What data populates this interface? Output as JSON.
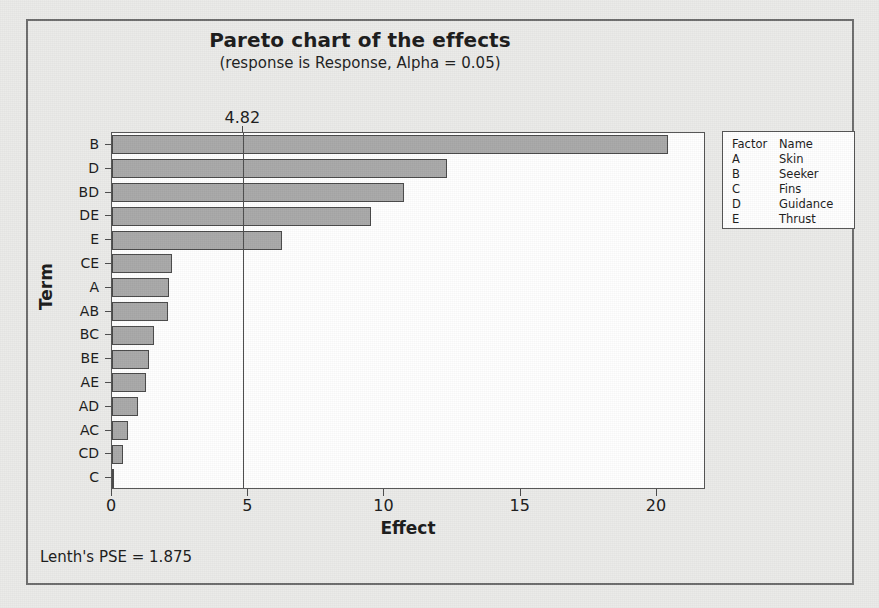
{
  "chart_data": {
    "type": "bar",
    "orientation": "horizontal",
    "title": "Pareto chart of the effects",
    "subtitle": "(response is Response, Alpha = 0.05)",
    "xlabel": "Effect",
    "ylabel": "Term",
    "categories": [
      "B",
      "D",
      "BD",
      "DE",
      "E",
      "CE",
      "A",
      "AB",
      "BC",
      "BE",
      "AE",
      "AD",
      "AC",
      "CD",
      "C"
    ],
    "values": [
      20.4,
      12.3,
      10.7,
      9.5,
      6.25,
      2.2,
      2.1,
      2.05,
      1.55,
      1.35,
      1.25,
      0.95,
      0.6,
      0.4,
      0.05
    ],
    "xlim": [
      0,
      21.8
    ],
    "xticks": [
      0,
      5,
      10,
      15,
      20
    ],
    "xtick_labels": [
      "0",
      "5",
      "10",
      "15",
      "20"
    ],
    "grid": false,
    "reference_line": {
      "value": 4.82,
      "label": "4.82"
    },
    "bar_color": "#a9a9a9",
    "bar_edge_color": "#4a4a4a",
    "legend_position": "right-outside"
  },
  "legend": {
    "headers": {
      "factor": "Factor",
      "name": "Name"
    },
    "rows": [
      {
        "factor": "A",
        "name": "Skin"
      },
      {
        "factor": "B",
        "name": "Seeker"
      },
      {
        "factor": "C",
        "name": "Fins"
      },
      {
        "factor": "D",
        "name": "Guidance"
      },
      {
        "factor": "E",
        "name": "Thrust"
      }
    ]
  },
  "footer": {
    "note": "Lenth's PSE = 1.875"
  }
}
